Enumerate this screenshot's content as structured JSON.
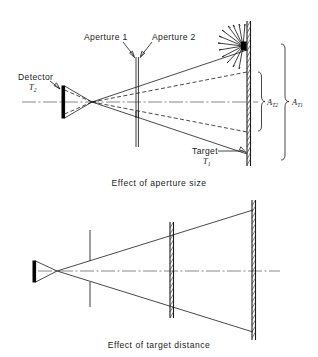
{
  "figure": {
    "panels": [
      {
        "id": "aperture-size",
        "caption": "Effect of aperture size",
        "labels": {
          "detector": "Detector",
          "detector_symbol": "T",
          "detector_subscript": "2",
          "aperture_1": "Aperture 1",
          "aperture_2": "Aperture 2",
          "target": "Target",
          "target_symbol": "T",
          "target_subscript": "1",
          "area_inner": "A",
          "area_inner_subscript": "T2",
          "area_outer": "A",
          "area_outer_subscript": "T1"
        }
      },
      {
        "id": "target-distance",
        "caption": "Effect of target distance"
      }
    ],
    "colors": {
      "ink": "#1a1a1a",
      "axis": "#555555",
      "background": "#ffffff",
      "target_fill": "#000000"
    }
  }
}
